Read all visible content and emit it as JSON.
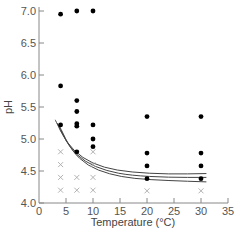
{
  "chart_data": {
    "type": "scatter",
    "title": "",
    "xlabel": "Temperature (°C)",
    "ylabel": "pH",
    "xlim": [
      0,
      35
    ],
    "ylim": [
      4.0,
      7.0
    ],
    "x_ticks": [
      0,
      5,
      10,
      15,
      20,
      25,
      30,
      35
    ],
    "y_ticks": [
      4.0,
      4.5,
      5.0,
      5.5,
      6.0,
      6.5,
      7.0
    ],
    "y_tick_labels": [
      "4.0",
      "4.5",
      "5.0",
      "5.5",
      "6.0",
      "6.5",
      "7.0"
    ],
    "grid": false,
    "legend": null,
    "series": [
      {
        "name": "growth",
        "marker": "filled-circle",
        "points": [
          {
            "x": 4,
            "y": 6.95
          },
          {
            "x": 7,
            "y": 7.0
          },
          {
            "x": 10,
            "y": 7.0
          },
          {
            "x": 4,
            "y": 5.83
          },
          {
            "x": 7,
            "y": 5.6
          },
          {
            "x": 7,
            "y": 5.43
          },
          {
            "x": 4,
            "y": 5.22
          },
          {
            "x": 7,
            "y": 5.24
          },
          {
            "x": 7,
            "y": 5.2
          },
          {
            "x": 10,
            "y": 5.22
          },
          {
            "x": 10,
            "y": 5.0
          },
          {
            "x": 10,
            "y": 4.88
          },
          {
            "x": 7,
            "y": 4.8
          },
          {
            "x": 20,
            "y": 5.35
          },
          {
            "x": 20,
            "y": 4.78
          },
          {
            "x": 20,
            "y": 4.58
          },
          {
            "x": 20,
            "y": 4.38
          },
          {
            "x": 30,
            "y": 5.35
          },
          {
            "x": 30,
            "y": 4.78
          },
          {
            "x": 30,
            "y": 4.58
          },
          {
            "x": 30,
            "y": 4.38
          }
        ]
      },
      {
        "name": "no growth",
        "marker": "cross",
        "points": [
          {
            "x": 4,
            "y": 4.8
          },
          {
            "x": 4,
            "y": 4.6
          },
          {
            "x": 4,
            "y": 4.4
          },
          {
            "x": 4,
            "y": 4.2
          },
          {
            "x": 7,
            "y": 4.4
          },
          {
            "x": 7,
            "y": 4.2
          },
          {
            "x": 10,
            "y": 4.8
          },
          {
            "x": 10,
            "y": 4.6
          },
          {
            "x": 10,
            "y": 4.4
          },
          {
            "x": 10,
            "y": 4.2
          },
          {
            "x": 20,
            "y": 4.19
          },
          {
            "x": 30,
            "y": 4.19
          }
        ]
      }
    ],
    "boundary_curves": [
      {
        "name": "upper",
        "points": [
          [
            3.0,
            5.3
          ],
          [
            5,
            4.95
          ],
          [
            8,
            4.7
          ],
          [
            12,
            4.55
          ],
          [
            17,
            4.48
          ],
          [
            24,
            4.45
          ],
          [
            31,
            4.46
          ]
        ]
      },
      {
        "name": "middle",
        "points": [
          [
            3.4,
            5.25
          ],
          [
            5.5,
            4.88
          ],
          [
            8.5,
            4.64
          ],
          [
            12.5,
            4.5
          ],
          [
            17,
            4.43
          ],
          [
            24,
            4.4
          ],
          [
            31,
            4.4
          ]
        ]
      },
      {
        "name": "lower",
        "points": [
          [
            3.8,
            5.2
          ],
          [
            6,
            4.82
          ],
          [
            9,
            4.58
          ],
          [
            13,
            4.45
          ],
          [
            17.5,
            4.38
          ],
          [
            24,
            4.35
          ],
          [
            31,
            4.33
          ]
        ]
      }
    ]
  }
}
